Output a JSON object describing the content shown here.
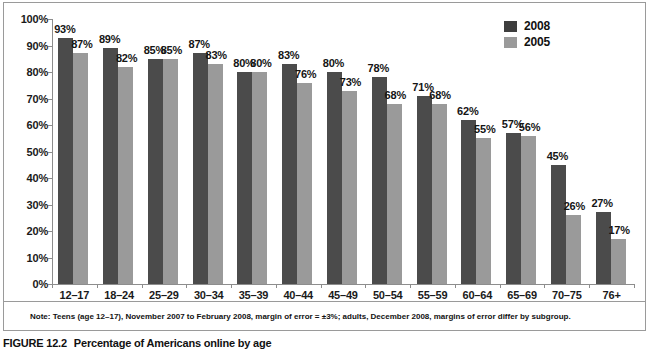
{
  "chart_data": {
    "type": "bar",
    "title": "",
    "xlabel": "",
    "ylabel": "",
    "ylim": [
      0,
      100
    ],
    "grid": false,
    "legend_position": "top-right",
    "categories": [
      "12–17",
      "18–24",
      "25–29",
      "30–34",
      "35–39",
      "40–44",
      "45–49",
      "50–54",
      "55–59",
      "60–64",
      "65–69",
      "70–75",
      "76+"
    ],
    "ytick_labels": [
      "100%",
      "90%",
      "80%",
      "70%",
      "60%",
      "50%",
      "40%",
      "30%",
      "20%",
      "10%",
      "0%"
    ],
    "ytick_values": [
      100,
      90,
      80,
      70,
      60,
      50,
      40,
      30,
      20,
      10,
      0
    ],
    "series": [
      {
        "name": "2008",
        "color": "#4b4b4b",
        "values": [
          93,
          89,
          85,
          87,
          80,
          83,
          80,
          78,
          71,
          62,
          57,
          45,
          27
        ],
        "labels": [
          "93%",
          "89%",
          "85%",
          "87%",
          "80%",
          "83%",
          "80%",
          "78%",
          "71%",
          "62%",
          "57%",
          "45%",
          "27%"
        ]
      },
      {
        "name": "2005",
        "color": "#9a9a9a",
        "values": [
          87,
          82,
          85,
          83,
          80,
          76,
          73,
          68,
          68,
          55,
          56,
          26,
          17
        ],
        "labels": [
          "87%",
          "82%",
          "85%",
          "83%",
          "80%",
          "76%",
          "73%",
          "68%",
          "68%",
          "55%",
          "56%",
          "26%",
          "17%"
        ]
      }
    ]
  },
  "legend": {
    "items": [
      {
        "label": "2008",
        "color": "#3e3e3e"
      },
      {
        "label": "2005",
        "color": "#9a9a9a"
      }
    ]
  },
  "note": {
    "text": "Note: Teens (age 12–17), November 2007 to February 2008, margin of error = ±3%; adults, December 2008, margins of error differ by subgroup."
  },
  "caption": {
    "number": "FIGURE 12.2",
    "text": "Percentage of Americans online by age"
  }
}
